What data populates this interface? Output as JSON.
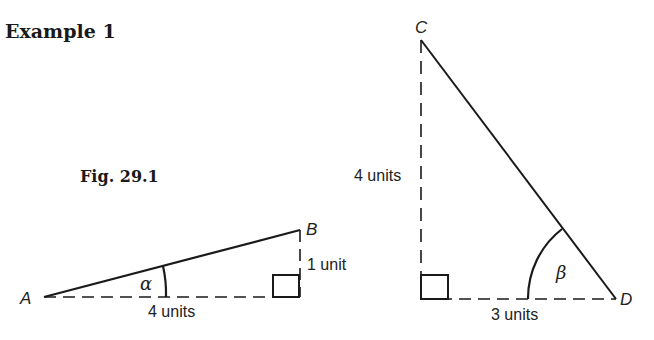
{
  "heading": "Example 1",
  "figure_label": "Fig. 29.1",
  "triangle_1": {
    "vertices": {
      "A": "A",
      "B": "B"
    },
    "angle": "α",
    "adjacent_label": "4 units",
    "opposite_label": "1 unit"
  },
  "triangle_2": {
    "vertices": {
      "C": "C",
      "D": "D"
    },
    "angle": "β",
    "adjacent_label": "3 units",
    "opposite_label": "4 units"
  },
  "colors": {
    "ink": "#1a1a1a",
    "background": "#ffffff"
  }
}
